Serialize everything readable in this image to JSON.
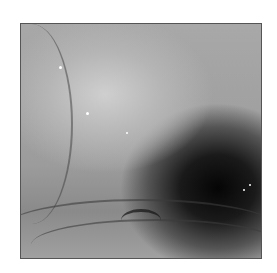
{
  "image": {
    "description": "Grayscale endoscopic view of gastric mucosa with dark lumen at lower right",
    "colors": {
      "background": "#ffffff",
      "mucosa_light": "#cfcfcf",
      "mucosa_mid": "#9c9c9c",
      "lumen_dark": "#050505"
    }
  }
}
